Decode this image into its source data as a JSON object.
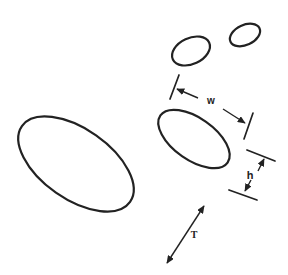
{
  "figure": {
    "background_color": "#ffffff",
    "line_color": "#222222",
    "canvas": {
      "width": 288,
      "height": 275
    },
    "ellipses": [
      {
        "name": "ellipse-large-left",
        "cx": 76,
        "cy": 164,
        "rx": 66,
        "ry": 35,
        "rotate": 35
      },
      {
        "name": "ellipse-medium-center",
        "cx": 194,
        "cy": 139,
        "rx": 41,
        "ry": 21,
        "rotate": 35
      },
      {
        "name": "ellipse-small-upper",
        "cx": 191,
        "cy": 51,
        "rx": 20,
        "ry": 13,
        "rotate": -25
      },
      {
        "name": "ellipse-smallest-upper-right",
        "cx": 245,
        "cy": 35,
        "rx": 16,
        "ry": 10,
        "rotate": -25
      }
    ],
    "dimensions": {
      "w": {
        "label": "w",
        "label_x": 211,
        "label_y": 101,
        "ticks": [
          {
            "x1": 170,
            "y1": 99,
            "x2": 179,
            "y2": 75
          },
          {
            "x1": 244,
            "y1": 139,
            "x2": 253,
            "y2": 113
          }
        ],
        "arrows": [
          {
            "x1": 198,
            "y1": 98,
            "x2": 177,
            "y2": 89
          },
          {
            "x1": 223,
            "y1": 109,
            "x2": 245,
            "y2": 123
          }
        ]
      },
      "h": {
        "label": "h",
        "label_x": 250,
        "label_y": 175,
        "ticks": [
          {
            "x1": 247,
            "y1": 150,
            "x2": 275,
            "y2": 161
          },
          {
            "x1": 229,
            "y1": 190,
            "x2": 257,
            "y2": 200
          }
        ],
        "arrows": [
          {
            "x1": 258,
            "y1": 171,
            "x2": 264,
            "y2": 159
          },
          {
            "x1": 251,
            "y1": 180,
            "x2": 245,
            "y2": 191
          }
        ]
      },
      "T": {
        "label": "T",
        "label_x": 194,
        "label_y": 235,
        "double_arrow": {
          "x1": 167,
          "y1": 263,
          "x2": 204,
          "y2": 206
        }
      }
    }
  }
}
